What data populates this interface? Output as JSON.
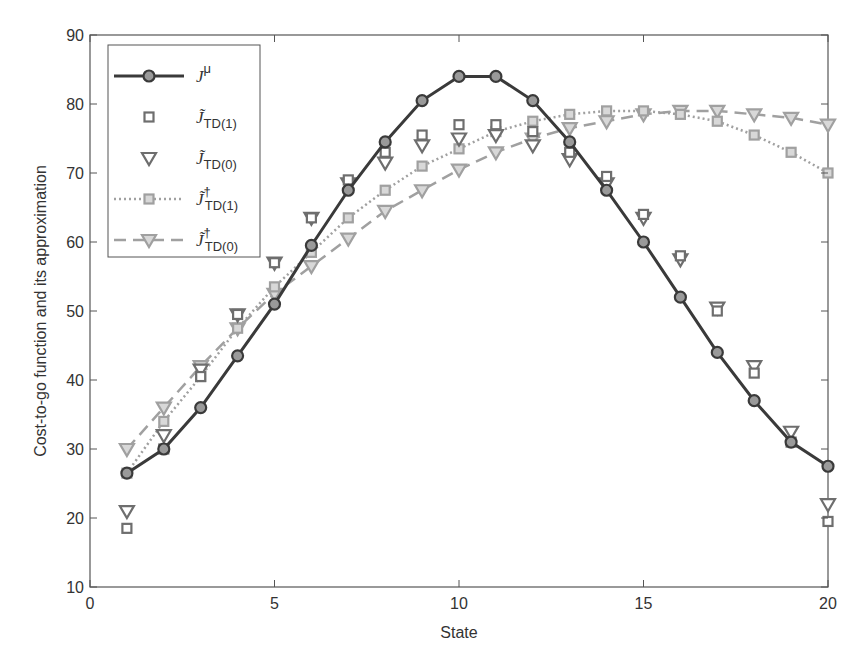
{
  "chart_data": {
    "type": "line",
    "title": "",
    "xlabel": "State",
    "ylabel": "Cost-to-go function and its approximation",
    "xlim": [
      0,
      20
    ],
    "ylim": [
      10,
      90
    ],
    "xticks": [
      0,
      5,
      10,
      15,
      20
    ],
    "yticks": [
      10,
      20,
      30,
      40,
      50,
      60,
      70,
      80,
      90
    ],
    "grid": false,
    "legend_position": "upper-left",
    "x": [
      1,
      2,
      3,
      4,
      5,
      6,
      7,
      8,
      9,
      10,
      11,
      12,
      13,
      14,
      15,
      16,
      17,
      18,
      19,
      20
    ],
    "series": [
      {
        "name": "J^μ",
        "label_main": "J",
        "label_sup": "μ",
        "label_sub": "",
        "style": "solid",
        "marker": "circle",
        "color": "#3a3a3a",
        "values": [
          26.5,
          30,
          36,
          43.5,
          51,
          59.5,
          67.5,
          74.5,
          80.5,
          84,
          84,
          80.5,
          74.5,
          67.5,
          60,
          52,
          44,
          37,
          31,
          27.5
        ]
      },
      {
        "name": "J̃_TD(1)",
        "label_main": "J̃",
        "label_sup": "",
        "label_sub": "TD(1)",
        "style": "none",
        "marker": "square",
        "color": "#6e6e6e",
        "values": [
          18.5,
          30,
          40.5,
          49.5,
          57,
          63.5,
          69,
          73,
          75.5,
          77,
          77,
          76,
          73,
          69.5,
          64,
          58,
          50,
          41,
          31,
          19.5
        ]
      },
      {
        "name": "J̃_TD(0)",
        "label_main": "J̃",
        "label_sup": "",
        "label_sub": "TD(0)",
        "style": "none",
        "marker": "triangle-down",
        "color": "#6e6e6e",
        "values": [
          21,
          32,
          41.5,
          49.5,
          57,
          63.5,
          68.5,
          71.5,
          74,
          75,
          75.5,
          74,
          72,
          68.5,
          63.5,
          57.5,
          50.5,
          42,
          32.5,
          22
        ]
      },
      {
        "name": "J̃†_TD(1)",
        "label_main": "J̃",
        "label_sup": "†",
        "label_sub": "TD(1)",
        "style": "dotted",
        "marker": "square",
        "color": "#a0a0a0",
        "values": [
          26.5,
          34,
          40.5,
          47.5,
          53.5,
          58.5,
          63.5,
          67.5,
          71,
          73.5,
          76,
          77.5,
          78.5,
          79,
          79,
          78.5,
          77.5,
          75.5,
          73,
          70
        ]
      },
      {
        "name": "J̃†_TD(0)",
        "label_main": "J̃",
        "label_sup": "†",
        "label_sub": "TD(0)",
        "style": "dashed",
        "marker": "triangle-down",
        "color": "#a0a0a0",
        "values": [
          30,
          36,
          42,
          47.5,
          52.5,
          56.5,
          60.5,
          64.5,
          67.5,
          70.5,
          73,
          75,
          76.5,
          77.5,
          78.5,
          79,
          79,
          78.5,
          78,
          77
        ]
      }
    ]
  }
}
